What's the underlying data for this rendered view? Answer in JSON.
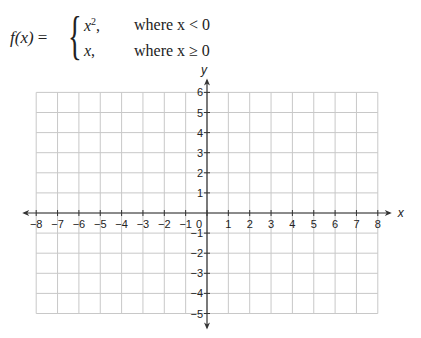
{
  "formula": {
    "lhs": "f(x)",
    "equals": "=",
    "cases": [
      {
        "expr": "x",
        "superscript": "2",
        "suffix": ",",
        "condition": "where x < 0"
      },
      {
        "expr": "x",
        "superscript": "",
        "suffix": ",",
        "condition": "where x ≥ 0"
      }
    ]
  },
  "chart_data": {
    "type": "line",
    "title": "",
    "xlabel": "x",
    "ylabel": "y",
    "xlim": [
      -8,
      8
    ],
    "ylim": [
      -5,
      6
    ],
    "grid": true,
    "x_ticks": [
      "-8",
      "-7",
      "-6",
      "-5",
      "-4",
      "-3",
      "-2",
      "-1",
      "0",
      "1",
      "2",
      "3",
      "4",
      "5",
      "6",
      "7",
      "8"
    ],
    "y_ticks": [
      "6",
      "5",
      "4",
      "3",
      "2",
      "1",
      "-1",
      "-2",
      "-3",
      "-4",
      "-5"
    ],
    "series": [],
    "annotations": [
      "Blank coordinate grid for graphing piecewise function"
    ]
  },
  "axes": {
    "x_label": "x",
    "y_label": "y",
    "x_ticks": [
      "−8",
      "−7",
      "−6",
      "−5",
      "−4",
      "−3",
      "−2",
      "−1",
      "0",
      "1",
      "2",
      "3",
      "4",
      "5",
      "6",
      "7",
      "8"
    ],
    "y_ticks_pos": [
      "6",
      "5",
      "4",
      "3",
      "2",
      "1"
    ],
    "y_ticks_neg": [
      "−1",
      "−2",
      "−3",
      "−4",
      "−5"
    ]
  },
  "colors": {
    "grid": "#c8c8c8",
    "axis": "#333333"
  }
}
